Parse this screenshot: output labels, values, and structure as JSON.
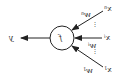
{
  "diagram": {
    "type": "perceptron (horizontally mirrored)",
    "node": {
      "label": "f"
    },
    "output": {
      "label": "y"
    },
    "inputs": [
      {
        "label": "x",
        "index": "n",
        "weight": "w",
        "weight_index": "n"
      },
      {
        "label": "x",
        "index": "i",
        "weight": "w",
        "weight_index": "i"
      },
      {
        "label": "x",
        "index": "1",
        "weight": "w",
        "weight_index": "1"
      }
    ],
    "ellipsis": "⋮",
    "colors": {
      "stroke": "#222222",
      "background": "#ffffff",
      "text": "#333333"
    }
  }
}
